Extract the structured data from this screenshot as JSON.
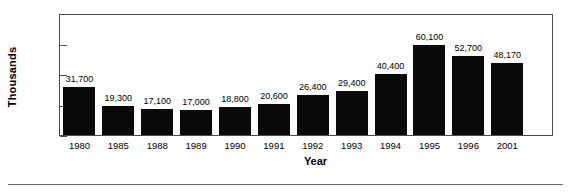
{
  "chart_data": {
    "type": "bar",
    "title": "",
    "xlabel": "Year",
    "ylabel": "Thousands",
    "categories": [
      "1980",
      "1985",
      "1988",
      "1989",
      "1990",
      "1991",
      "1992",
      "1993",
      "1994",
      "1995",
      "1996",
      "2001"
    ],
    "values": [
      31.7,
      19.3,
      17.1,
      17.0,
      18.8,
      20.6,
      26.4,
      29.4,
      40.4,
      60.1,
      52.7,
      48.17
    ],
    "data_labels": [
      "31,700",
      "19,300",
      "17,100",
      "17,000",
      "18,800",
      "20,600",
      "26,400",
      "29,400",
      "40,400",
      "60,100",
      "52,700",
      "48,170"
    ],
    "ylim": [
      0,
      80
    ],
    "yticks": [
      0,
      20,
      40,
      60,
      80
    ],
    "ytick_labels": [
      "0",
      "20",
      "40",
      "60",
      "80"
    ],
    "grid": false,
    "legend": null,
    "bar_color": "#0a0a0a",
    "frame_color": "#4c4c4c"
  }
}
